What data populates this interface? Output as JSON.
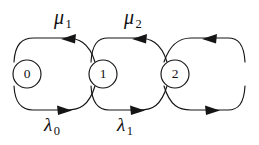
{
  "diagram": {
    "kind": "state-transition-diagram",
    "background_color": "#ffffff",
    "stroke_color": "#151515",
    "node_fill": "#ffffff",
    "nodes": [
      {
        "id": "state-0",
        "label": "0",
        "cx": 27,
        "cy": 74,
        "r": 14
      },
      {
        "id": "state-1",
        "label": "1",
        "cx": 103,
        "cy": 74,
        "r": 14
      },
      {
        "id": "state-2",
        "label": "2",
        "cx": 175,
        "cy": 74,
        "r": 14
      }
    ],
    "upper_labels": [
      {
        "id": "mu-1",
        "symbol": "μ",
        "subscript": "1",
        "x": 54,
        "y": 7
      },
      {
        "id": "mu-2",
        "symbol": "μ",
        "subscript": "2",
        "x": 124,
        "y": 7
      }
    ],
    "lower_labels": [
      {
        "id": "lambda-0",
        "symbol": "λ",
        "subscript": "0",
        "x": 44,
        "y": 115
      },
      {
        "id": "lambda-1",
        "symbol": "λ",
        "subscript": "1",
        "x": 117,
        "y": 115
      }
    ],
    "upper_edges": [
      {
        "id": "edge-1-to-0",
        "from": "state-1",
        "to": "state-0",
        "rate": "μ1",
        "direction": "left"
      },
      {
        "id": "edge-2-to-1",
        "from": "state-1",
        "to": "state-1",
        "rate": "μ2",
        "direction": "left"
      },
      {
        "id": "edge-3-to-2",
        "from": "state-3",
        "to": "state-2",
        "rate": "",
        "direction": "left"
      }
    ],
    "lower_edges": [
      {
        "id": "edge-0-to-1",
        "from": "state-0",
        "to": "state-1",
        "rate": "λ0",
        "direction": "right"
      },
      {
        "id": "edge-1-to-2",
        "from": "state-1",
        "to": "state-2",
        "rate": "λ1",
        "direction": "right"
      },
      {
        "id": "edge-2-to-3",
        "from": "state-2",
        "to": "state-3",
        "rate": "",
        "direction": "right"
      }
    ]
  }
}
